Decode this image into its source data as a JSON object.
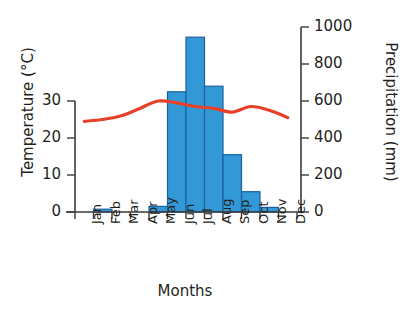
{
  "chart_data": {
    "type": "bar",
    "title": "",
    "subtitle": "",
    "xlabel": "Months",
    "categories": [
      "Jan",
      "Feb",
      "Mar",
      "Apr",
      "May",
      "Jun",
      "Jul",
      "Aug",
      "Sep",
      "Oct",
      "Nov",
      "Dec"
    ],
    "grid": false,
    "legend": "none",
    "axes": {
      "left": {
        "label": "Temperature (°C)",
        "unit": "°C",
        "ticks": [
          0,
          10,
          20,
          30
        ],
        "tick_labels": [
          "0",
          "10",
          "20",
          "30"
        ],
        "ylim": [
          0,
          40
        ]
      },
      "right": {
        "label": "Precipitation (mm)",
        "unit": "mm",
        "ticks": [
          0,
          200,
          400,
          600,
          800,
          1000
        ],
        "tick_labels": [
          "0",
          "200",
          "400",
          "600",
          "800",
          "1000"
        ],
        "ylim": [
          0,
          1000
        ]
      }
    },
    "series": [
      {
        "name": "Precipitation",
        "type": "bar",
        "axis": "right",
        "unit": "mm",
        "color": "#3399d6",
        "edge_color": "#1a5f9e",
        "values": [
          0,
          15,
          0,
          0,
          30,
          650,
          945,
          680,
          310,
          110,
          25,
          0
        ]
      },
      {
        "name": "Temperature",
        "type": "line",
        "axis": "left",
        "unit": "°C",
        "color": "#e8412a",
        "values": [
          24.5,
          25.0,
          26.0,
          28.0,
          30.0,
          29.5,
          28.5,
          28.0,
          27.0,
          28.5,
          27.5,
          25.5
        ]
      }
    ]
  },
  "colors": {
    "bar_fill": "#3399d6",
    "bar_edge": "#1a5f9e",
    "line": "#e8412a",
    "axis": "#3a3a3a",
    "text": "#231f20",
    "background": "#ffffff"
  }
}
